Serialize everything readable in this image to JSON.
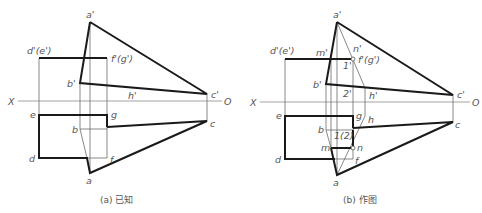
{
  "figure": {
    "panels": [
      {
        "id": "a",
        "caption": "(a) 已知",
        "labels": {
          "a_prime": "a'",
          "d_e_prime": "d'(e')",
          "f_g_prime": "f'(g')",
          "b_prime": "b'",
          "h_prime": "h'",
          "c_prime": "c'",
          "x_axis": "X",
          "o_axis": "O",
          "e": "e",
          "g": "g",
          "b": "b",
          "c": "c",
          "d": "d",
          "f": "f",
          "a": "a"
        }
      },
      {
        "id": "b",
        "caption": "(b) 作图",
        "labels": {
          "a_prime": "a'",
          "d_e_prime": "d'(e')",
          "m_prime": "m'",
          "n_prime": "n'",
          "one_prime": "1'",
          "f_g_prime": "f'(g')",
          "b_prime": "b'",
          "two_prime": "2'",
          "h_prime": "h'",
          "c_prime": "c'",
          "x_axis": "X",
          "o_axis": "O",
          "e": "e",
          "g": "g",
          "h": "h",
          "b": "b",
          "one_two": "1(2)",
          "m": "m",
          "n": "n",
          "c": "c",
          "d": "d",
          "f": "f",
          "a": "a"
        }
      }
    ],
    "colors": {
      "thick_line": "#1a1a1a",
      "thin_line": "#6a6a6a",
      "label": "#555555"
    }
  }
}
